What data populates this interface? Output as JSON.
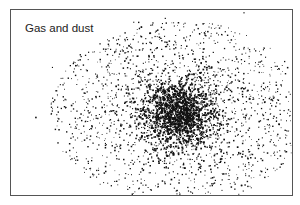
{
  "figure": {
    "label": "Gas and dust",
    "colors": {
      "background": "#ffffff",
      "dots": "#111111",
      "border": "#555555"
    },
    "cloud": {
      "center_x": 178,
      "center_y": 112,
      "outer_radius_x": 128,
      "outer_radius_y": 92,
      "core_radius": 22
    }
  }
}
